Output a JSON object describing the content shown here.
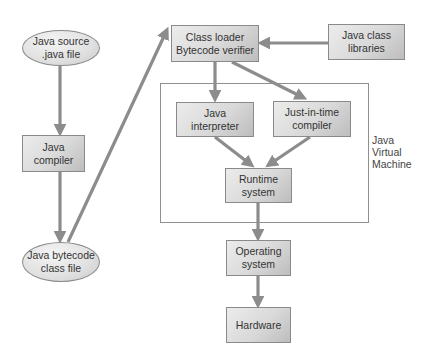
{
  "diagram": {
    "nodes": {
      "java_source": {
        "line1": "Java source",
        "line2": ".java file"
      },
      "java_compiler": {
        "line1": "Java",
        "line2": "compiler"
      },
      "java_bytecode": {
        "line1": "Java bytecode",
        "line2": "class file"
      },
      "class_loader": {
        "line1": "Class loader",
        "line2": "Bytecode verifier"
      },
      "class_libraries": {
        "line1": "Java class",
        "line2": "libraries"
      },
      "interpreter": {
        "line1": "Java",
        "line2": "interpreter"
      },
      "jit_compiler": {
        "line1": "Just-in-time",
        "line2": "compiler"
      },
      "runtime_system": {
        "line1": "Runtime",
        "line2": "system"
      },
      "operating_system": {
        "line1": "Operating",
        "line2": "system"
      },
      "hardware": {
        "line1": "Hardware"
      }
    },
    "container": {
      "label_line1": "Java",
      "label_line2": "Virtual",
      "label_line3": "Machine"
    },
    "edges": [
      {
        "from": "java_source",
        "to": "java_compiler"
      },
      {
        "from": "java_compiler",
        "to": "java_bytecode"
      },
      {
        "from": "java_bytecode",
        "to": "class_loader"
      },
      {
        "from": "class_libraries",
        "to": "class_loader"
      },
      {
        "from": "class_loader",
        "to": "interpreter"
      },
      {
        "from": "class_loader",
        "to": "jit_compiler"
      },
      {
        "from": "interpreter",
        "to": "runtime_system"
      },
      {
        "from": "jit_compiler",
        "to": "runtime_system"
      },
      {
        "from": "runtime_system",
        "to": "operating_system"
      },
      {
        "from": "operating_system",
        "to": "hardware"
      }
    ],
    "colors": {
      "arrow": "#8c8c8c",
      "border": "#8a8a8a",
      "fill": "#d9d9d9",
      "text": "#333333"
    }
  }
}
